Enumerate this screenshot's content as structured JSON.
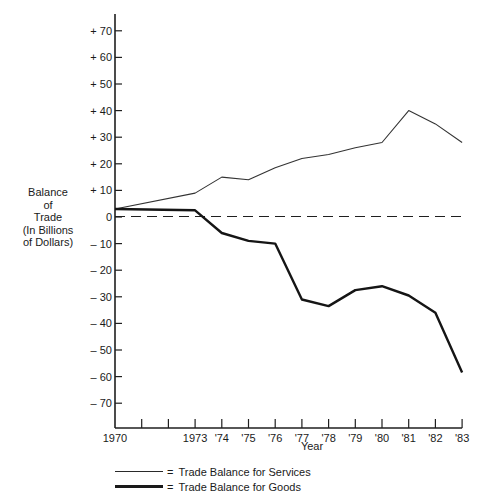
{
  "chart_data": {
    "type": "line",
    "title": "",
    "xlabel": "Year",
    "ylabel": "Balance of Trade (In Billions of Dollars)",
    "ylabel_lines": [
      "Balance",
      "of",
      "Trade",
      "(In Billions",
      "of Dollars)"
    ],
    "ylim": [
      -80,
      75
    ],
    "yticks": [
      70,
      60,
      50,
      40,
      30,
      20,
      10,
      0,
      -10,
      -20,
      -30,
      -40,
      -50,
      -60,
      -70
    ],
    "ytick_labels": [
      "+ 70",
      "+ 60",
      "+ 50",
      "+ 40",
      "+ 30",
      "+ 20",
      "+ 10",
      "0",
      "– 10",
      "– 20",
      "– 30",
      "– 40",
      "– 50",
      "– 60",
      "– 70"
    ],
    "x": [
      1970,
      1971,
      1972,
      1973,
      1974,
      1975,
      1976,
      1977,
      1978,
      1979,
      1980,
      1981,
      1982,
      1983
    ],
    "xtick_labels": [
      "1970",
      "",
      "",
      "1973",
      "'74",
      "'75",
      "'76",
      "'77",
      "'78",
      "'79",
      "'80",
      "'81",
      "'82",
      "'83"
    ],
    "grid": false,
    "reference_line": {
      "y": 0,
      "style": "dashed"
    },
    "legend_position": "bottom",
    "series": [
      {
        "name": "Trade Balance for Services",
        "style": "thin",
        "x": [
          1970,
          1973,
          1974,
          1975,
          1976,
          1977,
          1978,
          1979,
          1980,
          1981,
          1982,
          1983
        ],
        "values": [
          3,
          9,
          15,
          14,
          18.5,
          22,
          23.5,
          26,
          28,
          40,
          35,
          28
        ]
      },
      {
        "name": "Trade Balance for Goods",
        "style": "thick",
        "x": [
          1970,
          1973,
          1974,
          1975,
          1976,
          1977,
          1978,
          1979,
          1980,
          1981,
          1982,
          1983
        ],
        "values": [
          3,
          2.5,
          -6,
          -9,
          -10,
          -31,
          -33.5,
          -27.5,
          -26,
          -29.5,
          -36,
          -58.5
        ]
      }
    ]
  },
  "legend": {
    "equals": "=",
    "services_label": "Trade Balance for Services",
    "goods_label": "Trade Balance for Goods"
  },
  "axis": {
    "x_title": "Year"
  }
}
